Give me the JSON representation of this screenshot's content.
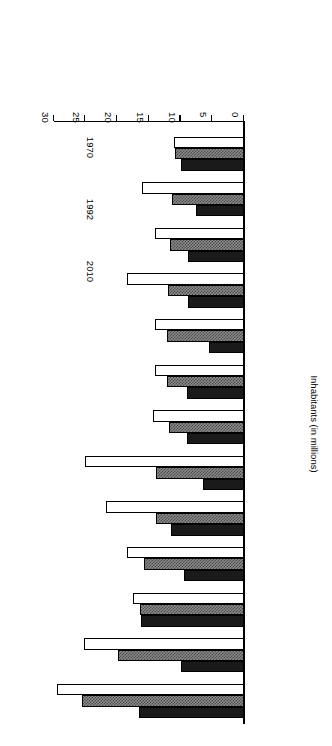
{
  "chart_data": {
    "type": "bar",
    "orientation": "horizontal",
    "title": "",
    "xlabel": "Inhabitants (in millions)",
    "ylabel": "",
    "categories": [
      "Tokyo",
      "Sao Paulo",
      "New York",
      "Mexico City",
      "Shanghai",
      "Bombay",
      "Los Angeles",
      "Buenos Aires",
      "Seoul",
      "Beijing",
      "Rio de Janeiro",
      "Calcutta",
      "Osaka"
    ],
    "series": [
      {
        "name": "1970",
        "color": "#1a1a1a",
        "values": [
          16.5,
          10.0,
          16.2,
          9.4,
          11.5,
          6.5,
          9.0,
          9.0,
          5.5,
          8.8,
          8.8,
          7.5,
          10.0
        ]
      },
      {
        "name": "1992",
        "color": "#8a8a8a",
        "values": [
          25.5,
          19.9,
          16.4,
          15.8,
          13.8,
          13.8,
          11.9,
          12.1,
          12.2,
          12.0,
          11.6,
          11.3,
          10.9
        ]
      },
      {
        "name": "2010",
        "color": "#ffffff",
        "values": [
          29.5,
          25.3,
          17.5,
          18.5,
          21.7,
          25.1,
          14.3,
          14.0,
          14.0,
          18.5,
          14.0,
          16.1,
          11.1
        ]
      }
    ],
    "value_axis": {
      "ticks": [
        0,
        5,
        10,
        15,
        20,
        25,
        30
      ],
      "tick_labels": [
        "0",
        "5",
        "10",
        "15",
        "20",
        "25",
        "30"
      ],
      "min": 0,
      "max": 30,
      "grid": false
    },
    "legend": {
      "position": "right",
      "entries": [
        {
          "label": "1970",
          "swatch": "solid-black"
        },
        {
          "label": "1992",
          "swatch": "hatched-gray"
        },
        {
          "label": "2010",
          "swatch": "outline-white"
        }
      ]
    },
    "rotation_note": "180"
  }
}
